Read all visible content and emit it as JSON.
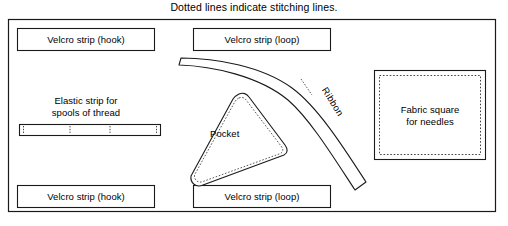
{
  "diagram": {
    "caption": "Dotted lines indicate stitching lines.",
    "colors": {
      "line": "#1a1a1a",
      "background": "#ffffff",
      "stitching": "#555555"
    },
    "outer_border": {
      "x": 8,
      "y": 19,
      "width": 488,
      "height": 193
    },
    "parts": [
      {
        "id": "velcro-strip-hook-top",
        "label": "Velcro strip (hook)",
        "shape": "rectangle",
        "stitching": "solid",
        "x": 17,
        "y": 28,
        "width": 138,
        "height": 23
      },
      {
        "id": "velcro-strip-loop-top",
        "label": "Velcro strip (loop)",
        "shape": "rectangle",
        "stitching": "solid",
        "x": 193,
        "y": 28,
        "width": 138,
        "height": 23
      },
      {
        "id": "elastic-strip",
        "label": "Elastic strip for\nspools of thread",
        "shape": "rectangle-divided",
        "stitching": "dotted",
        "x": 19,
        "y": 124,
        "width": 142,
        "height": 12,
        "divisions": 4
      },
      {
        "id": "pocket",
        "label": "Pocket",
        "shape": "rounded-triangle",
        "stitching": "dotted"
      },
      {
        "id": "ribbon",
        "label": "Ribbon",
        "shape": "curved-band",
        "stitching": "dotted"
      },
      {
        "id": "fabric-square",
        "label": "Fabric square\nfor needles",
        "shape": "square",
        "stitching": "dotted",
        "x": 374,
        "y": 70,
        "width": 112,
        "height": 90
      },
      {
        "id": "velcro-strip-hook-bottom",
        "label": "Velcro strip (hook)",
        "shape": "rectangle",
        "stitching": "solid",
        "x": 17,
        "y": 185,
        "width": 138,
        "height": 23
      },
      {
        "id": "velcro-strip-loop-bottom",
        "label": "Velcro strip (loop)",
        "shape": "rectangle",
        "stitching": "solid",
        "x": 193,
        "y": 185,
        "width": 138,
        "height": 23
      }
    ],
    "labels": {
      "velcro_hook_top": "Velcro strip (hook)",
      "velcro_loop_top": "Velcro strip (loop)",
      "velcro_hook_bottom": "Velcro strip (hook)",
      "velcro_loop_bottom": "Velcro strip (loop)",
      "elastic_strip": "Elastic strip for\nspools of thread",
      "fabric_square": "Fabric square\nfor needles",
      "pocket": "Pocket",
      "ribbon": "Ribbon"
    }
  }
}
